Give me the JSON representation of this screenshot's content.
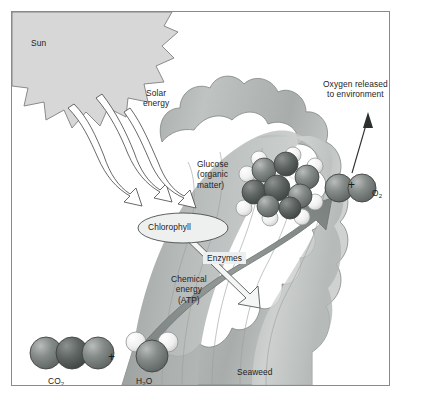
{
  "diagram": {
    "labels": {
      "sun": "Sun",
      "solar_energy": "Solar\nenergy",
      "glucose": "Glucose\n(organic\nmatter)",
      "oxygen_released": "Oxygen released\nto environment",
      "chlorophyll": "Chlorophyll",
      "enzymes": "Enzymes",
      "chemical_energy": "Chemical\nenergy\n(ATP)",
      "seaweed": "Seaweed",
      "plus_right": "+",
      "plus_bottom": "+"
    },
    "molecules": [
      {
        "name": "carbon-dioxide",
        "formula_main": "CO",
        "formula_sub": "2",
        "atoms": 3,
        "style": "three-dark-spheres"
      },
      {
        "name": "water",
        "formula_main": "H",
        "formula_sub": "2",
        "formula_tail": "O",
        "atoms": 3,
        "style": "one-dark-two-white-spheres"
      },
      {
        "name": "oxygen",
        "formula_main": "O",
        "formula_sub": "2",
        "atoms": 2,
        "style": "two-dark-spheres"
      },
      {
        "name": "glucose",
        "formula_main": "",
        "atoms": 12,
        "style": "ring-dark-with-white-hydrogens"
      }
    ],
    "arrows": [
      {
        "name": "solar-ray-1",
        "kind": "wavy-outline",
        "direction": "down-right"
      },
      {
        "name": "solar-ray-2",
        "kind": "wavy-outline",
        "direction": "down-right"
      },
      {
        "name": "solar-ray-3",
        "kind": "wavy-outline",
        "direction": "down-right"
      },
      {
        "name": "enzymes-arrow",
        "kind": "white-block",
        "direction": "down-right"
      },
      {
        "name": "synthesis-arrow",
        "kind": "thick-gray-curve",
        "direction": "up-right"
      },
      {
        "name": "oxygen-release-arrow",
        "kind": "thin-line",
        "direction": "up"
      }
    ],
    "colors": {
      "sun": "#d7d7d7",
      "seaweed_light": "#c9cccb",
      "seaweed_mid": "#aeb2b1",
      "seaweed_dark": "#8e9492",
      "arrow_gray": "#8f9593",
      "atom_dark": "#6f7472",
      "atom_light": "#f2f2f2",
      "border": "#8a8a8a",
      "text": "#1d1d1d",
      "background": "#ffffff"
    }
  }
}
